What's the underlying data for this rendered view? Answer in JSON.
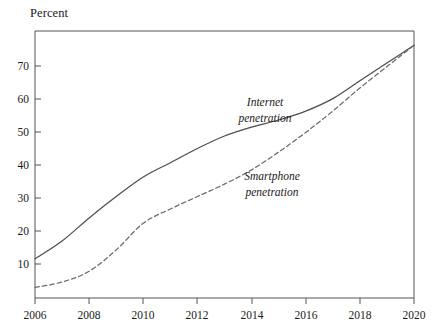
{
  "chart_data": {
    "type": "line",
    "title": "",
    "subtitle": "",
    "xlabel": "",
    "ylabel": "Percent",
    "ylabel_position": "top-left",
    "grid": false,
    "legend_position": "inline-annotations",
    "xlim": [
      2006,
      2020
    ],
    "ylim": [
      0,
      75
    ],
    "x_ticks": [
      2006,
      2008,
      2010,
      2012,
      2014,
      2016,
      2018,
      2020
    ],
    "x_tick_labels": [
      "2006",
      "2008",
      "2010",
      "2012",
      "2014",
      "2016",
      "2018",
      "2020"
    ],
    "y_ticks": [
      10,
      20,
      30,
      40,
      50,
      60,
      70
    ],
    "y_tick_labels": [
      "10",
      "20",
      "30",
      "40",
      "50",
      "60",
      "70"
    ],
    "x": [
      2006,
      2007,
      2008,
      2009,
      2010,
      2011,
      2012,
      2013,
      2014,
      2015,
      2016,
      2017,
      2018,
      2019,
      2020
    ],
    "series": [
      {
        "name": "Internet penetration",
        "label": "Internet",
        "label_line2": "penetration",
        "style": "solid",
        "color": "#4d4d4d",
        "values": [
          11,
          16,
          22.5,
          28.5,
          34,
          38,
          42,
          45.5,
          48,
          50,
          52.5,
          56,
          61,
          66,
          71
        ]
      },
      {
        "name": "Smartphone penetration",
        "label": "Smartphone",
        "label_line2": "penetration",
        "style": "dashed",
        "color": "#6b6b6b",
        "values": [
          3,
          4.5,
          7.5,
          13.5,
          21,
          25,
          28.5,
          32,
          36,
          41,
          46.5,
          52.5,
          59,
          65,
          71
        ]
      }
    ],
    "annotations": [
      {
        "text_line1": "Internet",
        "text_line2": "penetration",
        "x": 2013.0,
        "y": 57
      },
      {
        "text_line1": "Smartphone",
        "text_line2": "penetration",
        "x": 2013.4,
        "y": 37
      }
    ],
    "colors": {
      "background": "#ffffff",
      "frame": "#555555",
      "internet_line": "#4d4d4d",
      "smartphone_line": "#6b6b6b",
      "text": "#1a1a1a"
    }
  }
}
